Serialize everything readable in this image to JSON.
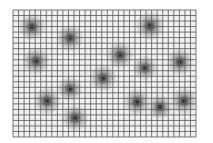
{
  "image": {
    "description": "Grid of thin dark lines overlaid on a light gray field with radially blurred dark spots",
    "background_color": "#ffffff",
    "field_color": "#f1f1f1",
    "grid_color": "#555555",
    "spot_color": "#222222"
  },
  "grid": {
    "left": 13,
    "top": 10,
    "right": 196,
    "bottom": 137,
    "cell_size": 5.55,
    "columns": 33,
    "rows": 23
  },
  "spots": [
    {
      "x": 32,
      "y": 27,
      "r": 13
    },
    {
      "x": 70,
      "y": 38,
      "r": 13
    },
    {
      "x": 150,
      "y": 26,
      "r": 14
    },
    {
      "x": 36,
      "y": 61,
      "r": 13
    },
    {
      "x": 120,
      "y": 55,
      "r": 13
    },
    {
      "x": 180,
      "y": 62,
      "r": 13
    },
    {
      "x": 145,
      "y": 68,
      "r": 12
    },
    {
      "x": 103,
      "y": 78,
      "r": 13
    },
    {
      "x": 70,
      "y": 89,
      "r": 12
    },
    {
      "x": 47,
      "y": 101,
      "r": 13
    },
    {
      "x": 137,
      "y": 102,
      "r": 13
    },
    {
      "x": 160,
      "y": 107,
      "r": 12
    },
    {
      "x": 184,
      "y": 101,
      "r": 13
    },
    {
      "x": 75,
      "y": 118,
      "r": 13
    }
  ]
}
